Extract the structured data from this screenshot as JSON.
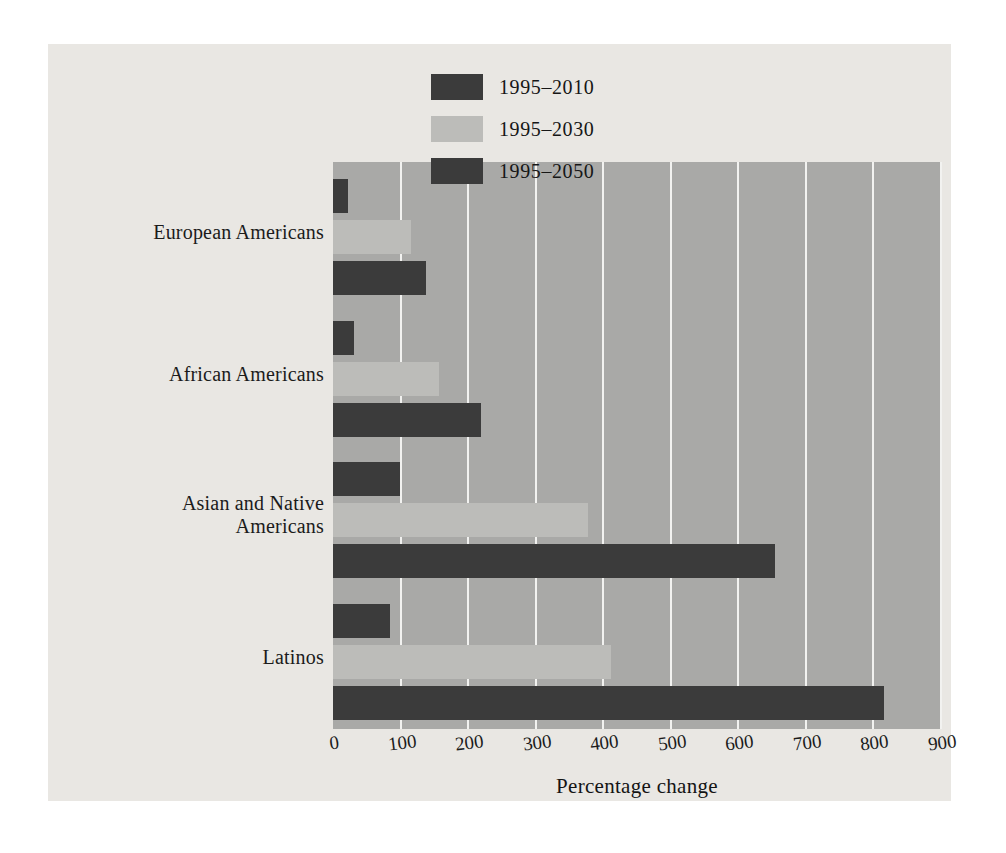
{
  "chart_data": {
    "type": "bar",
    "orientation": "horizontal",
    "title": "",
    "xlabel": "Percentage change",
    "ylabel": "",
    "xlim": [
      0,
      900
    ],
    "xticks": [
      0,
      100,
      200,
      300,
      400,
      500,
      600,
      700,
      800,
      900
    ],
    "xticklabels": [
      "0",
      "100",
      "200",
      "300",
      "400",
      "500",
      "600",
      "700",
      "800",
      "900"
    ],
    "grid": "vertical",
    "legend_position": "top-right",
    "categories": [
      "European Americans",
      "African Americans",
      "Asian and Native Americans",
      "Latinos"
    ],
    "series": [
      {
        "name": "1995–2010",
        "color": "#3b3b3b",
        "values": [
          22,
          31,
          99,
          85
        ]
      },
      {
        "name": "1995–2030",
        "color": "#bcbcb9",
        "values": [
          116,
          157,
          377,
          411
        ]
      },
      {
        "name": "1995–2050",
        "color": "#3b3b3b",
        "values": [
          137,
          219,
          654,
          815
        ]
      }
    ]
  },
  "colors": {
    "page_background": "#ffffff",
    "panel_background": "#e9e7e3",
    "plot_background": "#a9a9a7",
    "gridline": "#f2f2f0",
    "bar_dark": "#3b3b3b",
    "bar_light": "#bcbcb9",
    "text": "#1b1b1b"
  }
}
